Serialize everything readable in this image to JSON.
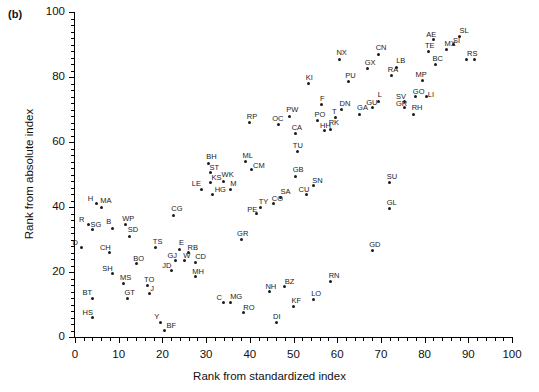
{
  "figure": {
    "panel_label": "(b)",
    "xlabel": "Rank from standardized index",
    "ylabel": "Rank from absolute index",
    "point_color": "#1b1b1b",
    "axis_color": "#000000",
    "background": "#ffffff"
  },
  "chart_data": {
    "type": "scatter",
    "title": "",
    "subtitle": "",
    "xlabel": "Rank from standardized index",
    "ylabel": "Rank from absolute index",
    "xlim": [
      0,
      100
    ],
    "ylim": [
      0,
      100
    ],
    "xticks": [
      0,
      10,
      20,
      30,
      40,
      50,
      60,
      70,
      80,
      90,
      100
    ],
    "yticks": [
      0,
      20,
      40,
      60,
      80,
      100
    ],
    "xtick_labels": [
      "0",
      "10",
      "20",
      "30",
      "40",
      "50",
      "60",
      "70",
      "80",
      "90",
      "100"
    ],
    "ytick_labels": [
      "0",
      "20",
      "40",
      "60",
      "80",
      "100"
    ],
    "minor_tick_step": 2,
    "grid": false,
    "legend": null,
    "annotations": [
      "(b)"
    ],
    "points": [
      {
        "label": "D",
        "x": 1.5,
        "y": 27.5,
        "lx": -9,
        "ly": -9
      },
      {
        "label": "R",
        "x": 3.0,
        "y": 34.5,
        "lx": -9,
        "ly": -9
      },
      {
        "label": "SG",
        "x": 4.0,
        "y": 33.0,
        "lx": -2,
        "ly": -9
      },
      {
        "label": "H",
        "x": 5.0,
        "y": 41.0,
        "lx": -9,
        "ly": -9
      },
      {
        "label": "MA",
        "x": 6.0,
        "y": 40.0,
        "lx": -1,
        "ly": -10
      },
      {
        "label": "BT",
        "x": 4.0,
        "y": 12.0,
        "lx": -10,
        "ly": -9
      },
      {
        "label": "HS",
        "x": 4.0,
        "y": 6.0,
        "lx": -10,
        "ly": -9
      },
      {
        "label": "CH",
        "x": 8.0,
        "y": 26.0,
        "lx": -10,
        "ly": -9
      },
      {
        "label": "SH",
        "x": 8.5,
        "y": 19.5,
        "lx": -10,
        "ly": -9
      },
      {
        "label": "B",
        "x": 8.5,
        "y": 33.5,
        "lx": -6,
        "ly": -10
      },
      {
        "label": "WP",
        "x": 11.5,
        "y": 34.5,
        "lx": -3,
        "ly": -10
      },
      {
        "label": "SD",
        "x": 12.5,
        "y": 31.0,
        "lx": -2,
        "ly": -10
      },
      {
        "label": "MS",
        "x": 11.0,
        "y": 16.5,
        "lx": -3,
        "ly": -9
      },
      {
        "label": "GT",
        "x": 12.0,
        "y": 12.0,
        "lx": -3,
        "ly": -9
      },
      {
        "label": "BO",
        "x": 14.0,
        "y": 22.5,
        "lx": -3,
        "ly": -9
      },
      {
        "label": "TO",
        "x": 16.5,
        "y": 16.0,
        "lx": -3,
        "ly": -9
      },
      {
        "label": "J",
        "x": 17.0,
        "y": 13.5,
        "lx": 1,
        "ly": -8
      },
      {
        "label": "TS",
        "x": 18.5,
        "y": 27.5,
        "lx": -3,
        "ly": -10
      },
      {
        "label": "Y",
        "x": 19.5,
        "y": 4.5,
        "lx": -6,
        "ly": -9
      },
      {
        "label": "BF",
        "x": 20.5,
        "y": 2.0,
        "lx": 2,
        "ly": -9
      },
      {
        "label": "JD",
        "x": 22.0,
        "y": 20.5,
        "lx": -9,
        "ly": -8
      },
      {
        "label": "GJ",
        "x": 23.0,
        "y": 23.5,
        "lx": -8,
        "ly": -9
      },
      {
        "label": "E",
        "x": 24.0,
        "y": 27.0,
        "lx": -1,
        "ly": -10
      },
      {
        "label": "W",
        "x": 25.0,
        "y": 23.5,
        "lx": -1,
        "ly": -9
      },
      {
        "label": "RB",
        "x": 26.0,
        "y": 26.0,
        "lx": -1,
        "ly": -9
      },
      {
        "label": "CD",
        "x": 27.5,
        "y": 23.0,
        "lx": 0,
        "ly": -9
      },
      {
        "label": "MH",
        "x": 27.5,
        "y": 18.5,
        "lx": -3,
        "ly": -9
      },
      {
        "label": "CG",
        "x": 22.5,
        "y": 37.5,
        "lx": -2,
        "ly": -10
      },
      {
        "label": "LE",
        "x": 29.0,
        "y": 45.5,
        "lx": -10,
        "ly": -9
      },
      {
        "label": "HG",
        "x": 31.5,
        "y": 44.0,
        "lx": 2,
        "ly": -8
      },
      {
        "label": "KS",
        "x": 31.0,
        "y": 47.5,
        "lx": 1,
        "ly": -9
      },
      {
        "label": "ST",
        "x": 31.0,
        "y": 50.5,
        "lx": -1,
        "ly": -9
      },
      {
        "label": "BH",
        "x": 30.5,
        "y": 53.5,
        "lx": -2,
        "ly": -10
      },
      {
        "label": "WK",
        "x": 34.0,
        "y": 48.0,
        "lx": -2,
        "ly": -10
      },
      {
        "label": "M",
        "x": 35.5,
        "y": 45.5,
        "lx": 0,
        "ly": -9
      },
      {
        "label": "C",
        "x": 34.0,
        "y": 10.5,
        "lx": -7,
        "ly": -9
      },
      {
        "label": "MG",
        "x": 35.5,
        "y": 10.5,
        "lx": 0,
        "ly": -10
      },
      {
        "label": "GR",
        "x": 38.0,
        "y": 30.0,
        "lx": -4,
        "ly": -10
      },
      {
        "label": "RO",
        "x": 38.5,
        "y": 7.5,
        "lx": 0,
        "ly": -9
      },
      {
        "label": "ML",
        "x": 39.0,
        "y": 54.0,
        "lx": -3,
        "ly": -10
      },
      {
        "label": "CM",
        "x": 40.5,
        "y": 51.5,
        "lx": 1,
        "ly": -8
      },
      {
        "label": "RP",
        "x": 40.0,
        "y": 66.0,
        "lx": -3,
        "ly": -10
      },
      {
        "label": "PE",
        "x": 41.5,
        "y": 38.0,
        "lx": -9,
        "ly": -8
      },
      {
        "label": "TY",
        "x": 42.5,
        "y": 40.0,
        "lx": -2,
        "ly": -9
      },
      {
        "label": "CO",
        "x": 45.5,
        "y": 41.0,
        "lx": -2,
        "ly": -9
      },
      {
        "label": "SA",
        "x": 47.0,
        "y": 43.0,
        "lx": 0,
        "ly": -9
      },
      {
        "label": "NH",
        "x": 44.5,
        "y": 14.0,
        "lx": -4,
        "ly": -9
      },
      {
        "label": "DI",
        "x": 46.0,
        "y": 4.5,
        "lx": -3,
        "ly": -9
      },
      {
        "label": "BZ",
        "x": 48.0,
        "y": 15.5,
        "lx": 0,
        "ly": -9
      },
      {
        "label": "KF",
        "x": 50.0,
        "y": 9.5,
        "lx": -2,
        "ly": -9
      },
      {
        "label": "LO",
        "x": 54.5,
        "y": 11.5,
        "lx": -2,
        "ly": -10
      },
      {
        "label": "RN",
        "x": 58.5,
        "y": 17.0,
        "lx": -2,
        "ly": -10
      },
      {
        "label": "GB",
        "x": 50.5,
        "y": 49.5,
        "lx": -3,
        "ly": -10
      },
      {
        "label": "CU",
        "x": 53.0,
        "y": 44.0,
        "lx": -8,
        "ly": -8
      },
      {
        "label": "SN",
        "x": 54.5,
        "y": 46.5,
        "lx": -1,
        "ly": -9
      },
      {
        "label": "TU",
        "x": 51.0,
        "y": 57.0,
        "lx": -5,
        "ly": -10
      },
      {
        "label": "CA",
        "x": 50.5,
        "y": 62.5,
        "lx": -4,
        "ly": -10
      },
      {
        "label": "OC",
        "x": 46.5,
        "y": 65.5,
        "lx": -6,
        "ly": -9
      },
      {
        "label": "PW",
        "x": 49.0,
        "y": 68.0,
        "lx": -3,
        "ly": -10
      },
      {
        "label": "PO",
        "x": 55.5,
        "y": 66.5,
        "lx": -3,
        "ly": -10
      },
      {
        "label": "HH",
        "x": 57.0,
        "y": 63.5,
        "lx": -4,
        "ly": -9
      },
      {
        "label": "RK",
        "x": 58.5,
        "y": 64.0,
        "lx": -2,
        "ly": -10
      },
      {
        "label": "KI",
        "x": 53.5,
        "y": 78.0,
        "lx": -3,
        "ly": -10
      },
      {
        "label": "F",
        "x": 56.5,
        "y": 71.5,
        "lx": -2,
        "ly": -10
      },
      {
        "label": "T",
        "x": 59.5,
        "y": 67.5,
        "lx": -3,
        "ly": -10
      },
      {
        "label": "DN",
        "x": 61.0,
        "y": 70.0,
        "lx": -2,
        "ly": -10
      },
      {
        "label": "GA",
        "x": 65.0,
        "y": 68.5,
        "lx": -2,
        "ly": -10
      },
      {
        "label": "GU",
        "x": 68.0,
        "y": 70.5,
        "lx": -6,
        "ly": -9
      },
      {
        "label": "L",
        "x": 69.5,
        "y": 72.5,
        "lx": -1,
        "ly": -10
      },
      {
        "label": "SU",
        "x": 72.0,
        "y": 47.5,
        "lx": -3,
        "ly": -10
      },
      {
        "label": "GL",
        "x": 72.0,
        "y": 39.5,
        "lx": -3,
        "ly": -10
      },
      {
        "label": "GD",
        "x": 68.0,
        "y": 26.5,
        "lx": -3,
        "ly": -10
      },
      {
        "label": "NX",
        "x": 60.5,
        "y": 85.5,
        "lx": -3,
        "ly": -10
      },
      {
        "label": "PU",
        "x": 62.5,
        "y": 78.5,
        "lx": -3,
        "ly": -10
      },
      {
        "label": "GX",
        "x": 67.0,
        "y": 82.5,
        "lx": -3,
        "ly": -10
      },
      {
        "label": "CN",
        "x": 69.5,
        "y": 87.0,
        "lx": -3,
        "ly": -10
      },
      {
        "label": "RA",
        "x": 72.5,
        "y": 80.5,
        "lx": -4,
        "ly": -9
      },
      {
        "label": "LB",
        "x": 73.5,
        "y": 83.0,
        "lx": 0,
        "ly": -10
      },
      {
        "label": "GR",
        "x": 75.5,
        "y": 70.5,
        "lx": -9,
        "ly": -8
      },
      {
        "label": "SV",
        "x": 75.5,
        "y": 72.5,
        "lx": -9,
        "ly": -8
      },
      {
        "label": "RH",
        "x": 77.5,
        "y": 68.5,
        "lx": -2,
        "ly": -10
      },
      {
        "label": "GO",
        "x": 78.0,
        "y": 74.0,
        "lx": -3,
        "ly": -9
      },
      {
        "label": "LI",
        "x": 80.5,
        "y": 74.0,
        "lx": 1,
        "ly": -6
      },
      {
        "label": "MP",
        "x": 79.5,
        "y": 79.0,
        "lx": -7,
        "ly": -9
      },
      {
        "label": "BC",
        "x": 82.5,
        "y": 84.0,
        "lx": -3,
        "ly": -9
      },
      {
        "label": "TE",
        "x": 81.0,
        "y": 88.0,
        "lx": -4,
        "ly": -9
      },
      {
        "label": "AE",
        "x": 82.0,
        "y": 91.5,
        "lx": -7,
        "ly": -9
      },
      {
        "label": "MX",
        "x": 85.0,
        "y": 88.5,
        "lx": -2,
        "ly": -9
      },
      {
        "label": "SI",
        "x": 86.5,
        "y": 90.0,
        "lx": 0,
        "ly": -8
      },
      {
        "label": "SL",
        "x": 88.0,
        "y": 92.5,
        "lx": 0,
        "ly": -9
      },
      {
        "label": "RS",
        "x": 89.5,
        "y": 85.5,
        "lx": 1,
        "ly": -9
      },
      {
        "label": "M2",
        "x": 91.5,
        "y": 85.5,
        "lx": 1,
        "ly": -9,
        "hidden": true
      }
    ]
  }
}
